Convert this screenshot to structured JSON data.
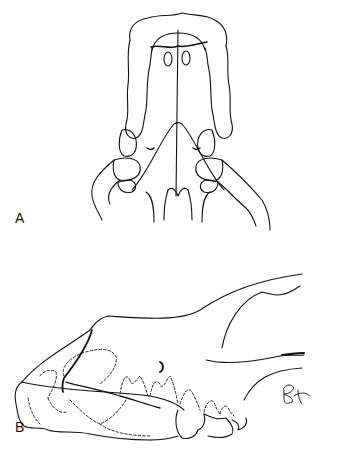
{
  "figure": {
    "panels": [
      {
        "label": "A",
        "view": "dorsal/ventral view of skull (palatal)"
      },
      {
        "label": "B",
        "view": "lateral view of skull"
      }
    ],
    "caption_visible": "illegible",
    "colors": {
      "ink": "#111111",
      "background": "#ffffff"
    }
  }
}
